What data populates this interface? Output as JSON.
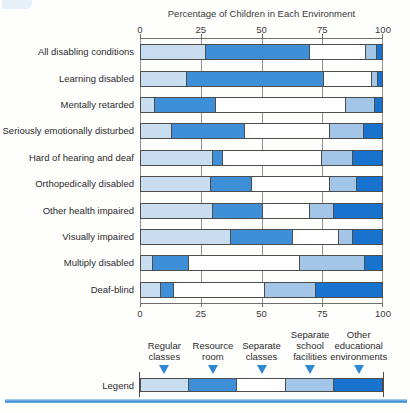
{
  "page": {
    "title": "Percentage of Children in Each Environment",
    "legend_caption": "Legend"
  },
  "colors": {
    "regular_classes": "#c9ddf1",
    "resource_room": "#3e8ed8",
    "separate_classes": "#ffffff",
    "separate_school_facilities": "#a3c6e8",
    "other_educational_environments": "#1873cf",
    "triangle_marker": "#2f87d2",
    "bottom_rule": "#2f87d2"
  },
  "chart_data": {
    "type": "bar",
    "orientation": "horizontal",
    "stacked": true,
    "title": "Percentage of Children in Each Environment",
    "xlabel": "Percentage of Children in Each Environment",
    "xlim": [
      0,
      100
    ],
    "axis_ticks": [
      0,
      25,
      50,
      75,
      100
    ],
    "grid": true,
    "legend_position": "bottom",
    "categories": [
      "All disabling conditions",
      "Learning disabled",
      "Mentally retarded",
      "Seriously emotionally disturbed",
      "Hard of hearing and deaf",
      "Orthopedically disabled",
      "Other health impaired",
      "Visually impaired",
      "Multiply disabled",
      "Deaf-blind"
    ],
    "series": [
      {
        "name": "Regular classes",
        "label_lines": [
          "Regular",
          "classes"
        ],
        "color": "#c9ddf1",
        "values": [
          27,
          19,
          6,
          13,
          30,
          29,
          30,
          37.5,
          5,
          8.5
        ]
      },
      {
        "name": "Resource room",
        "label_lines": [
          "Resource",
          "room"
        ],
        "color": "#3e8ed8",
        "values": [
          43,
          57,
          25,
          30,
          4,
          17,
          20.5,
          25.5,
          15,
          5
        ]
      },
      {
        "name": "Separate classes",
        "label_lines": [
          "Separate",
          "classes"
        ],
        "color": "#ffffff",
        "values": [
          23.5,
          20,
          54,
          35.5,
          41,
          32.5,
          19.5,
          19,
          46,
          38
        ]
      },
      {
        "name": "Separate school facilities",
        "label_lines": [
          "Separate",
          "school",
          "facilities"
        ],
        "color": "#a3c6e8",
        "values": [
          4.5,
          2.5,
          12,
          14,
          13,
          11,
          10,
          6,
          27,
          21
        ]
      },
      {
        "name": "Other educational environments",
        "label_lines": [
          "Other",
          "educational",
          "environments"
        ],
        "color": "#1873cf",
        "values": [
          2,
          1.5,
          3,
          7.5,
          12,
          10.5,
          20,
          12,
          7,
          27.5
        ]
      }
    ]
  }
}
